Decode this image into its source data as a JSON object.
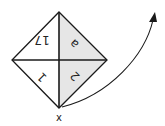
{
  "diagram": {
    "type": "folded-square-diamond",
    "quadrants": {
      "top_left": {
        "label": "17",
        "rotated": true,
        "shaded": false
      },
      "top_right": {
        "label": "a",
        "rotated": true,
        "shaded": true
      },
      "bottom_left": {
        "label": "1",
        "rotated": true,
        "shaded": false
      },
      "bottom_right": {
        "label": "2",
        "rotated": true,
        "shaded": true
      }
    },
    "pivot_label": "x",
    "arrow": {
      "direction": "curved-up-right",
      "meaning": "rotation about x"
    },
    "colors": {
      "shade": "#e6e6e6",
      "stroke": "#1a1a1a"
    }
  }
}
